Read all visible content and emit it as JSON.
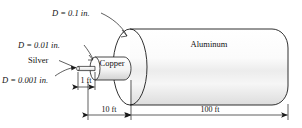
{
  "figure": {
    "materials": {
      "silver_label": "Silver",
      "copper_label": "Copper",
      "aluminum_label": "Aluminum"
    },
    "diameter_labels": {
      "aluminum": "D  =  0.1 in.",
      "copper": "D  =  0.01 in.",
      "silver": "D  =  0.001 in."
    },
    "length_labels": {
      "silver": "1 ft",
      "copper": "10 ft",
      "aluminum": "100 ft"
    },
    "colors": {
      "line": "#1a1a1a",
      "shade_light": "#e9e9e9",
      "shade_mid": "#d7d7d7",
      "background": "#ffffff"
    }
  }
}
